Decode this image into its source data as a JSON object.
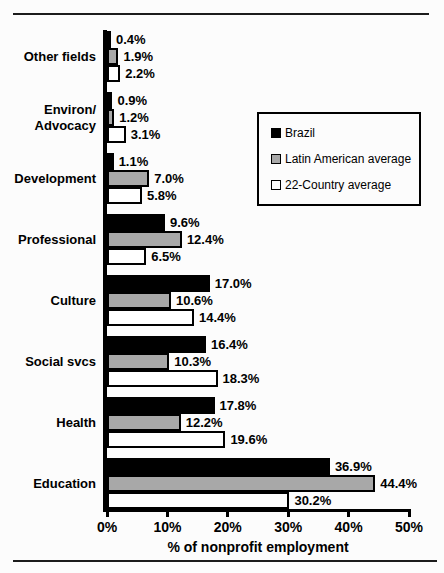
{
  "chart_data": {
    "type": "bar",
    "orientation": "horizontal",
    "title": "",
    "xlabel": "% of nonprofit employment",
    "ylabel": "",
    "xlim": [
      0,
      50
    ],
    "xticks": [
      0,
      10,
      20,
      30,
      40,
      50
    ],
    "xtick_suffix": "%",
    "value_suffix": "%",
    "value_decimals": 1,
    "grid": false,
    "legend_position": "upper-right",
    "bar_border_color": "#000000",
    "categories": [
      "Other fields",
      "Environ/\nAdvocacy",
      "Development",
      "Professional",
      "Culture",
      "Social svcs",
      "Health",
      "Education"
    ],
    "series": [
      {
        "name": "Brazil",
        "color": "#000000",
        "values": [
          0.4,
          0.9,
          1.1,
          9.6,
          17.0,
          16.4,
          17.8,
          36.9
        ]
      },
      {
        "name": "Latin American average",
        "color": "#a8a8a8",
        "values": [
          1.9,
          1.2,
          7.0,
          12.4,
          10.6,
          10.3,
          12.2,
          44.4
        ]
      },
      {
        "name": "22-Country average",
        "color": "#ffffff",
        "values": [
          2.2,
          3.1,
          5.8,
          6.5,
          14.4,
          18.3,
          19.6,
          30.2
        ]
      }
    ]
  }
}
